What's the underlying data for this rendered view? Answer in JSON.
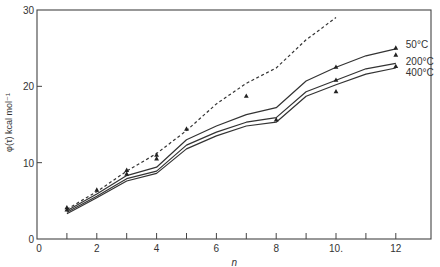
{
  "chart_data": {
    "type": "line",
    "title": "",
    "xlabel": "n",
    "ylabel": "φ(τ) kcal mol⁻¹",
    "xlim": [
      0,
      13.2
    ],
    "ylim": [
      0,
      30
    ],
    "grid": false,
    "x_ticks": [
      0,
      1,
      2,
      3,
      4,
      5,
      6,
      7,
      8,
      9,
      10,
      11,
      12
    ],
    "x_tick_labels": [
      "0",
      "",
      "2",
      "",
      "4",
      "",
      "6",
      "",
      "8",
      "",
      "10.",
      "",
      "12"
    ],
    "y_ticks": [
      0,
      10,
      20,
      30
    ],
    "y_tick_labels": [
      "0",
      "10",
      "20",
      "30"
    ],
    "series": [
      {
        "name": "dashed",
        "style": "dashed",
        "x": [
          1,
          2,
          3,
          4,
          5,
          6,
          7,
          8,
          9,
          10
        ],
        "values": [
          3.9,
          6.2,
          8.9,
          11.2,
          14.2,
          17.7,
          20.4,
          22.4,
          26.1,
          29.0
        ]
      },
      {
        "name": "50°C",
        "style": "solid",
        "x": [
          1,
          2,
          3,
          4,
          5,
          6,
          7,
          8,
          9,
          10,
          11,
          12
        ],
        "values": [
          3.7,
          5.9,
          8.3,
          9.4,
          13.0,
          14.8,
          16.3,
          17.2,
          20.7,
          22.5,
          24.0,
          24.9
        ]
      },
      {
        "name": "200°C",
        "style": "solid",
        "x": [
          1,
          2,
          3,
          4,
          5,
          6,
          7,
          8,
          9,
          10,
          11,
          12
        ],
        "values": [
          3.5,
          5.6,
          7.9,
          8.9,
          12.3,
          14.0,
          15.3,
          15.9,
          19.3,
          20.8,
          22.3,
          23.0
        ]
      },
      {
        "name": "400°C",
        "style": "solid",
        "x": [
          1,
          2,
          3,
          4,
          5,
          6,
          7,
          8,
          9,
          10,
          11,
          12
        ],
        "values": [
          3.3,
          5.4,
          7.6,
          8.6,
          11.8,
          13.5,
          14.8,
          15.3,
          18.7,
          20.2,
          21.6,
          22.4
        ]
      }
    ],
    "points": {
      "marker": "triangle",
      "x": [
        1,
        1,
        2,
        3,
        3,
        4,
        4,
        5,
        7,
        8,
        10,
        10,
        10,
        12,
        12,
        12
      ],
      "values": [
        4.1,
        3.8,
        6.4,
        9.0,
        8.5,
        11.0,
        10.5,
        14.4,
        18.7,
        15.6,
        22.5,
        20.8,
        19.3,
        25.0,
        24.1,
        22.6
      ]
    },
    "annotations": [
      {
        "text": "50°C",
        "x": 12.2,
        "y": 25.4
      },
      {
        "text": "200°C",
        "x": 12.2,
        "y": 23.2
      },
      {
        "text": "400°C",
        "x": 12.2,
        "y": 21.8
      }
    ]
  }
}
